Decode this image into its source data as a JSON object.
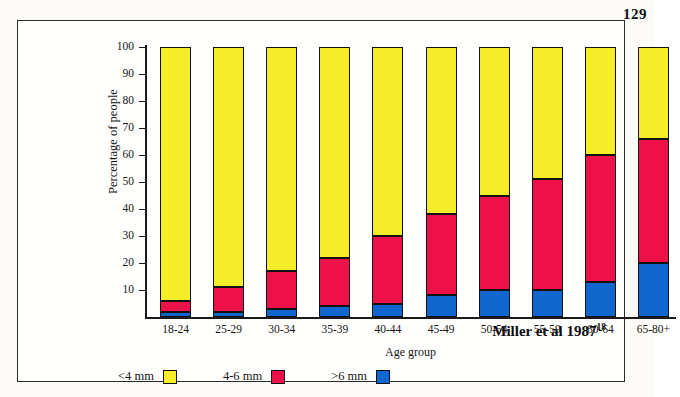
{
  "page": {
    "page_number": "129"
  },
  "citation": {
    "text": "Miller et al 1987",
    "reference_number": "18"
  },
  "axes": {
    "y_title": "Percentage of people",
    "x_title": "Age group",
    "y_ticks": [
      10,
      20,
      30,
      40,
      50,
      60,
      70,
      80,
      90,
      100
    ]
  },
  "legend": {
    "position": "bottom",
    "entries": [
      {
        "label": "<4 mm",
        "color": "#F5ED28"
      },
      {
        "label": "4-6 mm",
        "color": "#EE1049"
      },
      {
        "label": ">6 mm",
        "color": "#0F66CC"
      }
    ]
  },
  "chart_data": {
    "type": "bar",
    "title": "",
    "subtitle": "",
    "stacked": true,
    "xlabel": "Age group",
    "ylabel": "Percentage of people",
    "ylim": [
      0,
      100
    ],
    "grid": false,
    "legend_position": "bottom",
    "annotations": [
      "Miller et al 1987 18"
    ],
    "categories": [
      "18-24",
      "25-29",
      "30-34",
      "35-39",
      "40-44",
      "45-49",
      "50-54",
      "55-59",
      "60-64",
      "65-80+"
    ],
    "tick_labels_y": [
      "10",
      "20",
      "30",
      "40",
      "50",
      "60",
      "70",
      "80",
      "90",
      "100"
    ],
    "series": [
      {
        "name": ">6 mm",
        "color": "#0F66CC",
        "values": [
          2,
          2,
          3,
          4,
          5,
          8,
          10,
          10,
          13,
          20
        ]
      },
      {
        "name": "4-6 mm",
        "color": "#EE1049",
        "values": [
          4,
          9,
          14,
          18,
          25,
          30,
          35,
          41,
          47,
          46
        ]
      },
      {
        "name": "<4 mm",
        "color": "#F5ED28",
        "values": [
          94,
          89,
          83,
          78,
          70,
          62,
          55,
          49,
          40,
          34
        ]
      }
    ],
    "cumulative_tops": {
      ">6 mm": [
        2,
        2,
        3,
        4,
        5,
        8,
        10,
        10,
        13,
        20
      ],
      "4-6 mm": [
        6,
        11,
        17,
        22,
        30,
        38,
        45,
        51,
        60,
        66
      ],
      "<4 mm": [
        100,
        100,
        100,
        100,
        100,
        100,
        100,
        100,
        100,
        100
      ]
    }
  }
}
